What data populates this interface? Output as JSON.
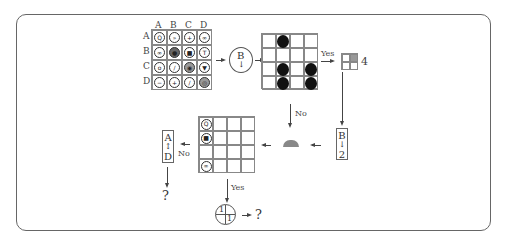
{
  "diagram": {
    "column_labels": [
      "A",
      "B",
      "C",
      "D"
    ],
    "row_labels": [
      "A",
      "B",
      "C",
      "D"
    ],
    "symbol_grid": [
      [
        {
          "icon": "search-icon",
          "glyph": "Q",
          "fill": "none"
        },
        {
          "icon": "fast-forward-icon",
          "glyph": "»",
          "fill": "none"
        },
        {
          "icon": "plus-icon",
          "glyph": "+",
          "fill": "none"
        },
        {
          "icon": "infinity-icon",
          "glyph": "∞",
          "fill": "none"
        }
      ],
      [
        {
          "icon": "double-circle-icon",
          "glyph": "∞",
          "fill": "none"
        },
        {
          "icon": "filled-circle-icon",
          "glyph": "●",
          "fill": "dark"
        },
        {
          "icon": "folder-icon",
          "glyph": "■",
          "fill": "none"
        },
        {
          "icon": "antenna-icon",
          "glyph": "T",
          "fill": "none"
        }
      ],
      [
        {
          "icon": "eye-icon",
          "glyph": "o",
          "fill": "none"
        },
        {
          "icon": "pencil-icon",
          "glyph": "/",
          "fill": "none"
        },
        {
          "icon": "target-icon",
          "glyph": "◉",
          "fill": "gray"
        },
        {
          "icon": "cup-icon",
          "glyph": "▼",
          "fill": "none"
        }
      ],
      [
        {
          "icon": "minus-icon",
          "glyph": "−",
          "fill": "none"
        },
        {
          "icon": "plus-icon",
          "glyph": "+",
          "fill": "none"
        },
        {
          "icon": "slash-icon",
          "glyph": "/",
          "fill": "none"
        },
        {
          "icon": "ring-icon",
          "glyph": "◎",
          "fill": "gray"
        }
      ]
    ],
    "selector_circle": {
      "letter": "B",
      "arrow": "↓"
    },
    "dot_grid": [
      [
        0,
        1,
        0,
        0
      ],
      [
        0,
        0,
        0,
        0
      ],
      [
        0,
        1,
        0,
        1
      ],
      [
        0,
        1,
        0,
        1
      ]
    ],
    "yes_label_1": "Yes",
    "no_label_1": "No",
    "small_grid_value": "4",
    "b_to_2_box": {
      "top": "B",
      "arrow": "↓",
      "bottom": "2"
    },
    "half_dome_symbol": "half-dome-icon",
    "result_grid": {
      "rows": 4,
      "cols": 4,
      "first_column_icons": [
        "search-icon",
        "folder-icon",
        "",
        "infinity-icon"
      ],
      "first_column_glyphs": [
        "Q",
        "■",
        "",
        "∞"
      ]
    },
    "no_label_2": "No",
    "a_to_d_box": {
      "top": "A",
      "arrow": "↕",
      "bottom": "D"
    },
    "question_1": "?",
    "yes_label_2": "Yes",
    "quad_circle": {
      "top_left": "1",
      "bottom_right": "1"
    },
    "question_2": "?",
    "colors": {
      "line": "#444444",
      "dot": "#111111",
      "shaded": "#999999",
      "frame": "#666666"
    }
  }
}
